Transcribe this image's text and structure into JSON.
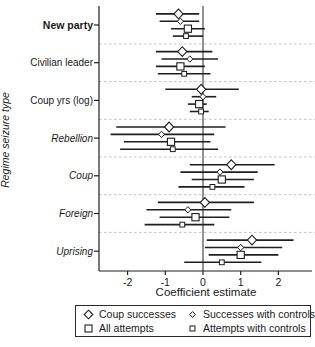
{
  "figure": {
    "xlabel": "Coefficient estimate",
    "ylabel": "Regime seizure type"
  },
  "colors": {
    "line": "#1f1f1f",
    "marker_fill": "#ffffff",
    "zero_line": "#3a3a3a",
    "separator": "#c2c2c2",
    "text": "#1a1a1a"
  },
  "legend": {
    "items": [
      {
        "label": "Coup successes",
        "marker": "diamond",
        "size": "large"
      },
      {
        "label": "All attempts",
        "marker": "square",
        "size": "large"
      },
      {
        "label": "Successes with controls",
        "marker": "diamond",
        "size": "small"
      },
      {
        "label": "Attempts with controls",
        "marker": "square",
        "size": "small"
      }
    ]
  },
  "chart_data": {
    "type": "scatter",
    "subtype": "forest-coefficient-plot",
    "title": "",
    "xlabel": "Coefficient estimate",
    "ylabel": "Regime seizure type",
    "x_ticks": [
      -2,
      -1,
      0,
      1,
      2
    ],
    "xlim": [
      -2.8,
      2.95
    ],
    "reference_line_x": 0,
    "grid": false,
    "legend_position": "bottom",
    "series": [
      "Coup successes",
      "Successes with controls",
      "All attempts",
      "Attempts with controls"
    ],
    "series_markers": [
      "large-diamond",
      "small-diamond",
      "large-square",
      "small-square"
    ],
    "categories": [
      {
        "label": "New party",
        "label_style": "bold",
        "estimates": [
          {
            "series": "Coup successes",
            "est": -0.65,
            "ci": [
              -1.25,
              -0.1
            ]
          },
          {
            "series": "Successes with controls",
            "est": -0.6,
            "ci": [
              -1.15,
              -0.1
            ]
          },
          {
            "series": "All attempts",
            "est": -0.4,
            "ci": [
              -0.85,
              0.05
            ]
          },
          {
            "series": "Attempts with controls",
            "est": -0.45,
            "ci": [
              -0.8,
              0.0
            ]
          }
        ]
      },
      {
        "label": "Civilian leader",
        "label_style": "normal",
        "estimates": [
          {
            "series": "Coup successes",
            "est": -0.55,
            "ci": [
              -1.25,
              0.25
            ]
          },
          {
            "series": "Successes with controls",
            "est": -0.35,
            "ci": [
              -1.1,
              0.4
            ]
          },
          {
            "series": "All attempts",
            "est": -0.6,
            "ci": [
              -1.25,
              0.05
            ]
          },
          {
            "series": "Attempts with controls",
            "est": -0.5,
            "ci": [
              -1.2,
              0.2
            ]
          }
        ]
      },
      {
        "label": "Coup yrs (log)",
        "label_style": "normal",
        "estimates": [
          {
            "series": "Coup successes",
            "est": -0.05,
            "ci": [
              -1.0,
              0.95
            ]
          },
          {
            "series": "Successes with controls",
            "est": 0.0,
            "ci": [
              -0.3,
              0.35
            ]
          },
          {
            "series": "All attempts",
            "est": -0.1,
            "ci": [
              -0.4,
              0.1
            ]
          },
          {
            "series": "Attempts with controls",
            "est": -0.05,
            "ci": [
              -0.35,
              0.15
            ]
          }
        ]
      },
      {
        "label": "Rebellion",
        "label_style": "italic",
        "estimates": [
          {
            "series": "Coup successes",
            "est": -0.9,
            "ci": [
              -2.3,
              0.6
            ]
          },
          {
            "series": "Successes with controls",
            "est": -1.1,
            "ci": [
              -2.45,
              0.3
            ]
          },
          {
            "series": "All attempts",
            "est": -0.85,
            "ci": [
              -2.1,
              0.2
            ]
          },
          {
            "series": "Attempts with controls",
            "est": -0.8,
            "ci": [
              -2.2,
              0.4
            ]
          }
        ]
      },
      {
        "label": "Coup",
        "label_style": "italic",
        "estimates": [
          {
            "series": "Coup successes",
            "est": 0.75,
            "ci": [
              -0.35,
              1.9
            ]
          },
          {
            "series": "Successes with controls",
            "est": 0.45,
            "ci": [
              -0.6,
              1.45
            ]
          },
          {
            "series": "All attempts",
            "est": 0.5,
            "ci": [
              -0.3,
              1.35
            ]
          },
          {
            "series": "Attempts with controls",
            "est": 0.25,
            "ci": [
              -0.65,
              1.1
            ]
          }
        ]
      },
      {
        "label": "Foreign",
        "label_style": "italic",
        "estimates": [
          {
            "series": "Coup successes",
            "est": 0.05,
            "ci": [
              -1.2,
              1.35
            ]
          },
          {
            "series": "Successes with controls",
            "est": -0.4,
            "ci": [
              -1.5,
              0.75
            ]
          },
          {
            "series": "All attempts",
            "est": -0.2,
            "ci": [
              -1.15,
              0.7
            ]
          },
          {
            "series": "Attempts with controls",
            "est": -0.55,
            "ci": [
              -1.55,
              0.3
            ]
          }
        ]
      },
      {
        "label": "Uprising",
        "label_style": "italic",
        "estimates": [
          {
            "series": "Coup successes",
            "est": 1.3,
            "ci": [
              0.1,
              2.4
            ]
          },
          {
            "series": "Successes with controls",
            "est": 1.0,
            "ci": [
              0.05,
              2.1
            ]
          },
          {
            "series": "All attempts",
            "est": 1.0,
            "ci": [
              0.15,
              2.0
            ]
          },
          {
            "series": "Attempts with controls",
            "est": 0.5,
            "ci": [
              -0.5,
              1.55
            ]
          }
        ]
      }
    ]
  }
}
